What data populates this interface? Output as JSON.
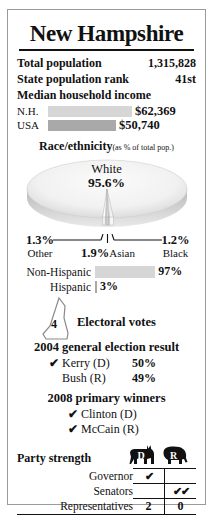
{
  "card": {
    "title": "New Hampshire",
    "stats": [
      {
        "label": "Total population",
        "value": "1,315,828"
      },
      {
        "label": "State population rank",
        "value": "41st"
      }
    ],
    "income": {
      "heading": "Median household income",
      "rows": [
        {
          "label": "N.H.",
          "value": "$62,369",
          "pct": 100,
          "color": "#d6d6d6"
        },
        {
          "label": "USA",
          "value": "$50,740",
          "pct": 81,
          "color": "#a9a9a9"
        }
      ]
    },
    "race": {
      "title": "Race/ethnicity",
      "note": "(as % of total pop.)",
      "main_label": "White",
      "main_value": "95.6%",
      "slices": [
        {
          "name": "Other",
          "value": "1.3%"
        },
        {
          "name": "Asian",
          "value": "1.9%"
        },
        {
          "name": "Black",
          "value": "1.2%"
        }
      ]
    },
    "hispanic": {
      "rows": [
        {
          "label": "Non-Hispanic",
          "value": "97%",
          "pct": 97,
          "color": "#d6d6d6"
        },
        {
          "label": "Hispanic",
          "value": "3%",
          "pct": 3,
          "color": "#a9a9a9"
        }
      ]
    },
    "electoral": {
      "count": "4",
      "label": "Electoral votes"
    },
    "general_2004": {
      "title": "2004 general election result",
      "rows": [
        {
          "check": "✔",
          "name": "Kerry (D)",
          "pct": "50%"
        },
        {
          "check": "",
          "name": "Bush (R)",
          "pct": "49%"
        }
      ]
    },
    "primary_2008": {
      "title": "2008 primary winners",
      "rows": [
        {
          "check": "✔",
          "name": "Clinton (D)",
          "pct": ""
        },
        {
          "check": "✔",
          "name": "McCain (R)",
          "pct": ""
        }
      ]
    },
    "party_strength": {
      "title": "Party strength",
      "dem_letter": "D",
      "rep_letter": "R",
      "rows": [
        {
          "label": "Governor",
          "dem": "✔",
          "rep": ""
        },
        {
          "label": "Senators",
          "dem": "",
          "rep": "✔✔"
        },
        {
          "label": "Representatives",
          "dem": "2",
          "rep": "0"
        }
      ]
    }
  }
}
